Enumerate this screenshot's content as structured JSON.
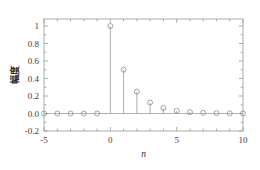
{
  "chart_data": {
    "type": "scatter",
    "plot_style": "stem",
    "title": "",
    "subtitle": "",
    "xlabel": "n",
    "ylabel": "幅度",
    "xlim": [
      -5,
      10
    ],
    "ylim": [
      -0.2,
      1.08
    ],
    "xticks": [
      -5,
      0,
      5,
      10
    ],
    "xtick_labels": [
      "-5",
      "0",
      "5",
      "10"
    ],
    "yticks": [
      -0.2,
      0.0,
      0.2,
      0.4,
      0.6,
      0.8,
      1
    ],
    "ytick_labels": [
      "-0.2",
      "0.0",
      "0.2",
      "0.4",
      "0.6",
      "0.8",
      "1"
    ],
    "x_minor_tick_step": 1,
    "y_minor_tick_step": 0.1,
    "grid": false,
    "legend": null,
    "legend_position": "none",
    "marker": "open-circle",
    "marker_color": "#8e8e8e",
    "line_color": "#9b9b9b",
    "axis_color": "#9a9a9a",
    "background_color": "#ffffff",
    "x": [
      -5,
      -4,
      -3,
      -2,
      -1,
      0,
      1,
      2,
      3,
      4,
      5,
      6,
      7,
      8,
      9,
      10
    ],
    "values": [
      0,
      0,
      0,
      0,
      0,
      1,
      0.5,
      0.25,
      0.125,
      0.0625,
      0.03125,
      0.015625,
      0.0078125,
      0.00390625,
      0.001953125,
      0.0009765625
    ],
    "annotations": []
  },
  "figure": {
    "name": "stem-plot-figure"
  }
}
